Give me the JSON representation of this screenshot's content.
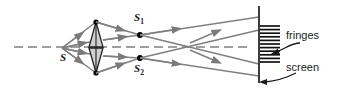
{
  "diagram": {
    "type": "optics-ray-diagram",
    "canvas": {
      "width": 339,
      "height": 95,
      "background": "#ffffff"
    },
    "colors": {
      "ray": "#808080",
      "axis": "#808080",
      "screen": "#333333",
      "fringe": "#111111",
      "prism_fill": "#cccccc",
      "prism_stroke": "#222222",
      "point": "#000000",
      "text": "#1a1a1a",
      "callout": "#1a1a1a"
    },
    "labels": {
      "source": "S",
      "slit_top": "S",
      "slit_top_sub": "1",
      "slit_bottom": "S",
      "slit_bottom_sub": "2",
      "fringes": "fringes",
      "screen": "screen"
    },
    "points": {
      "source": {
        "x": 62,
        "y": 48,
        "name": "S"
      },
      "prism_apex_top": {
        "x": 96,
        "y": 22
      },
      "prism_apex_bottom": {
        "x": 96,
        "y": 73
      },
      "virtual_source_top": {
        "x": 140,
        "y": 35,
        "name": "S1"
      },
      "virtual_source_bottom": {
        "x": 140,
        "y": 58,
        "name": "S2"
      }
    },
    "axis": {
      "y": 47,
      "x_start": 14,
      "x_end": 250,
      "style": "dashed",
      "dash": "9 5"
    },
    "screen": {
      "x": 259,
      "y_top": 6,
      "y_bottom": 83,
      "width": 1.8
    },
    "fringes": {
      "count": 11,
      "x_start": 260,
      "x_end": 280,
      "y_first": 26,
      "spacing": 3.6,
      "thickness": 1.7
    },
    "rays": {
      "count": 8,
      "arrowheads": 11,
      "description": "rays from S through biprism to virtual sources S1 and S2, then crossing to screen"
    }
  }
}
